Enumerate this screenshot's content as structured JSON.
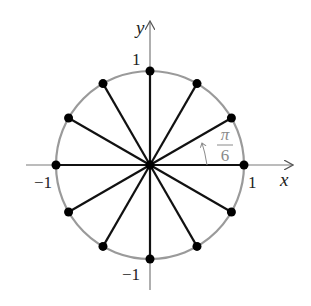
{
  "diagram": {
    "center": {
      "x": 150,
      "y": 165
    },
    "radius_px": 94,
    "angle_step_label": {
      "num": "π",
      "den": "6"
    },
    "num_points": 12,
    "axes": {
      "x_label": "x",
      "y_label": "y",
      "x_ticks": [
        {
          "value": -1,
          "label": "−1"
        },
        {
          "value": 1,
          "label": "1"
        }
      ],
      "y_ticks": [
        {
          "value": 1,
          "label": "1"
        },
        {
          "value": -1,
          "label": "−1"
        }
      ]
    },
    "colors": {
      "circle": "#9a9a9a",
      "spokes": "#111111",
      "points": "#000000",
      "axes": "#7a7a7a",
      "angle_annotation": "#8a8a8a"
    }
  }
}
